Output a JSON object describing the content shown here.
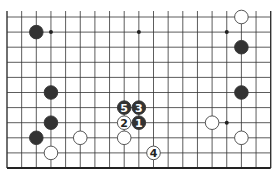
{
  "board": {
    "description": "Go board diagram, partial view (bottom edge and right edge visible)",
    "grid": {
      "cols": 19,
      "rows": 11,
      "x0": 7,
      "dx": 14.65,
      "y0": 17,
      "dy": 15.1,
      "line_color": "#333333",
      "edge_color": "#222222"
    },
    "star_points": [
      {
        "col": 9,
        "row": 1
      },
      {
        "col": 3,
        "row": 1
      },
      {
        "col": 15,
        "row": 1
      },
      {
        "col": 15,
        "row": 7
      }
    ],
    "stones": [
      {
        "color": "black",
        "col": 2,
        "row": 1
      },
      {
        "color": "white",
        "col": 16,
        "row": 0
      },
      {
        "color": "black",
        "col": 16,
        "row": 2
      },
      {
        "color": "black",
        "col": 3,
        "row": 5
      },
      {
        "color": "black",
        "col": 16,
        "row": 5
      },
      {
        "color": "black",
        "col": 3,
        "row": 7
      },
      {
        "color": "black",
        "col": 2,
        "row": 8
      },
      {
        "color": "white",
        "col": 5,
        "row": 8
      },
      {
        "color": "white",
        "col": 3,
        "row": 9
      },
      {
        "color": "white",
        "col": 8,
        "row": 8
      },
      {
        "color": "white",
        "col": 14,
        "row": 7
      },
      {
        "color": "white",
        "col": 16,
        "row": 8
      }
    ],
    "numbered_stones": [
      {
        "color": "black",
        "col": 9,
        "row": 7,
        "label": "1"
      },
      {
        "color": "white",
        "col": 8,
        "row": 7,
        "label": "2"
      },
      {
        "color": "black",
        "col": 9,
        "row": 6,
        "label": "3"
      },
      {
        "color": "white",
        "col": 10,
        "row": 9,
        "label": "4"
      },
      {
        "color": "black",
        "col": 8,
        "row": 6,
        "label": "5"
      }
    ],
    "colors": {
      "black_stone": "#333333",
      "white_stone": "#ffffff",
      "white_stroke": "#444444",
      "black_label": "#ffffff",
      "white_label": "#222222"
    }
  }
}
